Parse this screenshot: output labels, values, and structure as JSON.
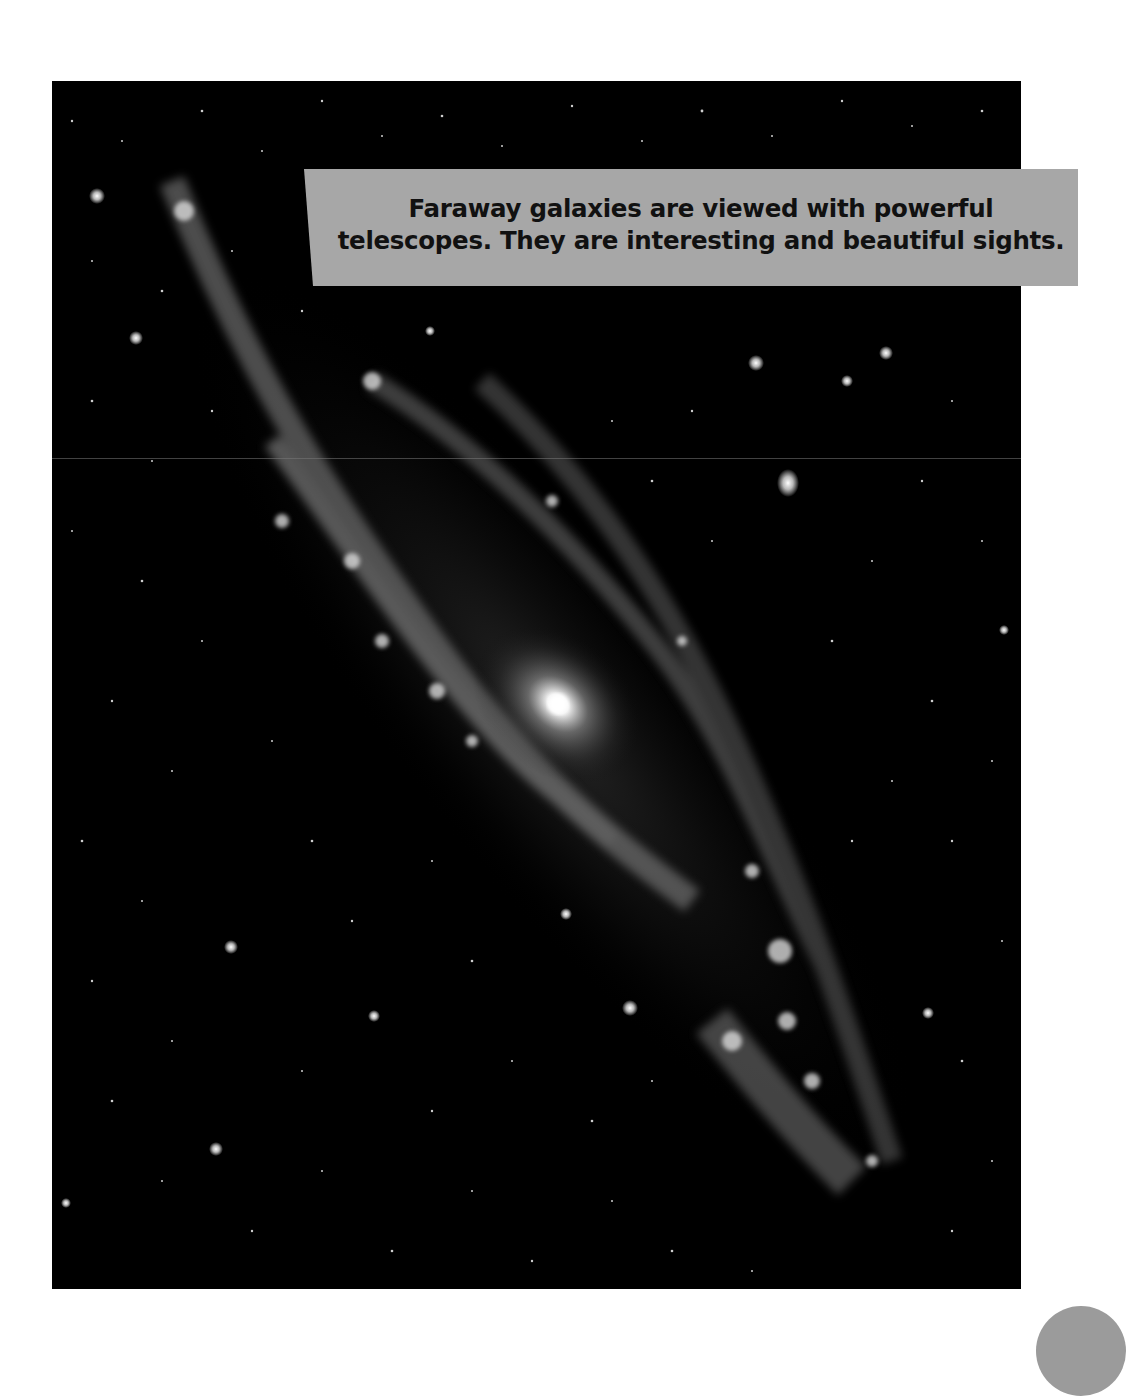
{
  "page": {
    "background": "#ffffff"
  },
  "photo": {
    "subject": "spiral galaxy",
    "background_color": "#000000"
  },
  "caption": {
    "line1": "Faraway galaxies are viewed with powerful",
    "line2": "telescopes. They are interesting and beautiful sights.",
    "background_color": "#a7a7a7",
    "text_color": "#111111"
  },
  "page_tab": {
    "color": "#9b9b9b"
  }
}
